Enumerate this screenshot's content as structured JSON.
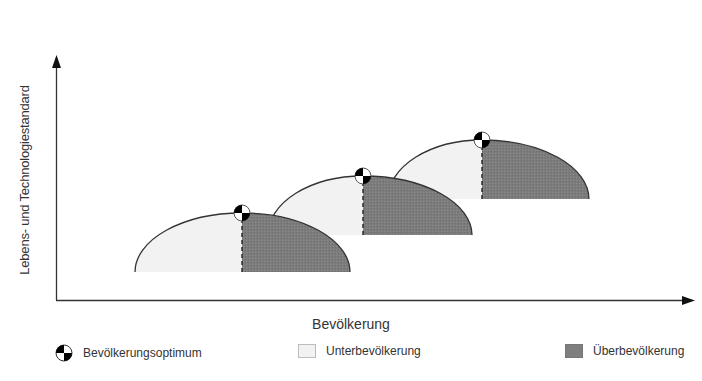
{
  "axes": {
    "y_label": "Lebens- und Technologiestandard",
    "x_label": "Bevölkerung"
  },
  "colors": {
    "under_fill": "#f2f2f2",
    "over_fill": "#7f7f7f",
    "curve": "#333333",
    "marker": "#000000"
  },
  "hills": [
    {
      "label": "Stufe 1",
      "left_x": 135,
      "peak_x": 242,
      "right_x": 350,
      "base_y": 272,
      "peak_y": 213
    },
    {
      "label": "Stufe 2",
      "left_x": 268,
      "peak_x": 363,
      "right_x": 472,
      "base_y": 235,
      "peak_y": 176
    },
    {
      "label": "Stufe 3",
      "left_x": 388,
      "peak_x": 482,
      "right_x": 589,
      "base_y": 199,
      "peak_y": 140
    }
  ],
  "legend": {
    "optimum": {
      "label": "Bevölkerungsoptimum",
      "icon": "quartered-circle-icon"
    },
    "under": {
      "label": "Unterbevölkerung"
    },
    "over": {
      "label": "Überbevölkerung"
    }
  }
}
